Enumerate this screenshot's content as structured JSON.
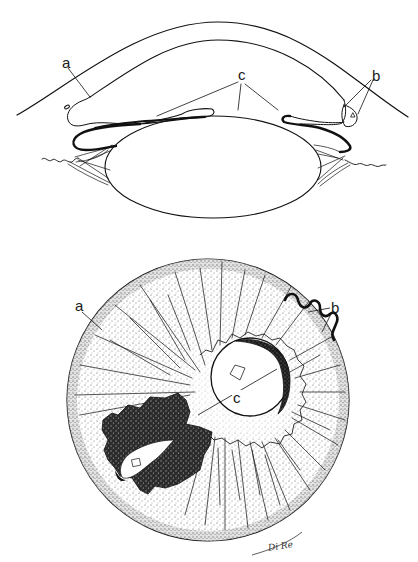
{
  "figure": {
    "top_view": {
      "description": "Cross-section of anterior eye: cornea, iris, lens with zonules",
      "labels": {
        "a": "a",
        "b": "b",
        "c": "c"
      }
    },
    "bottom_view": {
      "description": "Frontal view of iris with pupil and dark pigmented patch",
      "labels": {
        "a": "a",
        "b": "b",
        "c": "c"
      }
    },
    "signature": "Di Re",
    "colors": {
      "ink": "#111111",
      "paper": "#ffffff",
      "stipple": "#6a6a6a",
      "pigment": "#2a2a2a"
    }
  }
}
